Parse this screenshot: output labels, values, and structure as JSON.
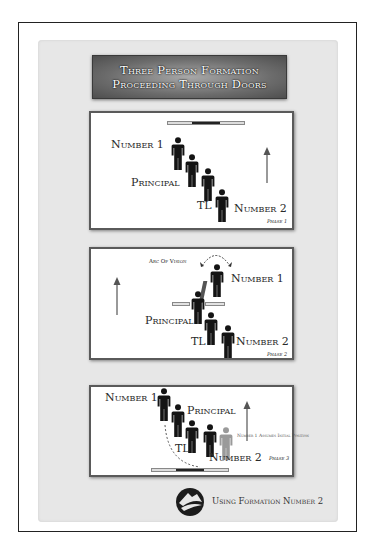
{
  "title": {
    "line1": "Three Person Formation",
    "line2": "Proceeding Through Doors"
  },
  "panels": [
    {
      "phase": "Phase 1",
      "labels": {
        "number1": "Number 1",
        "principal": "Principal",
        "tl": "TL",
        "number2": "Number 2"
      },
      "icons": [
        "doorway-bar",
        "direction-arrow-up",
        "person-icon x4"
      ]
    },
    {
      "phase": "Phase 2",
      "labels": {
        "arc": "Arc Of Vision",
        "number1": "Number 1",
        "principal": "Principal",
        "tl": "TL",
        "number2": "Number 2"
      },
      "icons": [
        "arc-of-vision-arrow",
        "open-door",
        "direction-arrow-up",
        "person-icon x4"
      ]
    },
    {
      "phase": "Phase 3",
      "labels": {
        "number1": "Number 1",
        "principal": "Principal",
        "tl": "TL",
        "number2": "Number 2",
        "note": "Number 1 Assumes Initial Position"
      },
      "icons": [
        "doorway-bar",
        "dashed-path",
        "direction-arrow-up",
        "person-icon x4",
        "ghost-person-icon"
      ]
    }
  ],
  "footer": {
    "text": "Using Formation Number 2",
    "logo": "mountain-logo-icon"
  },
  "colors": {
    "figure": "#141414",
    "ghost_figure": "#9a9a9a",
    "arrow": "#555555",
    "banner": "#6c6c6c"
  }
}
